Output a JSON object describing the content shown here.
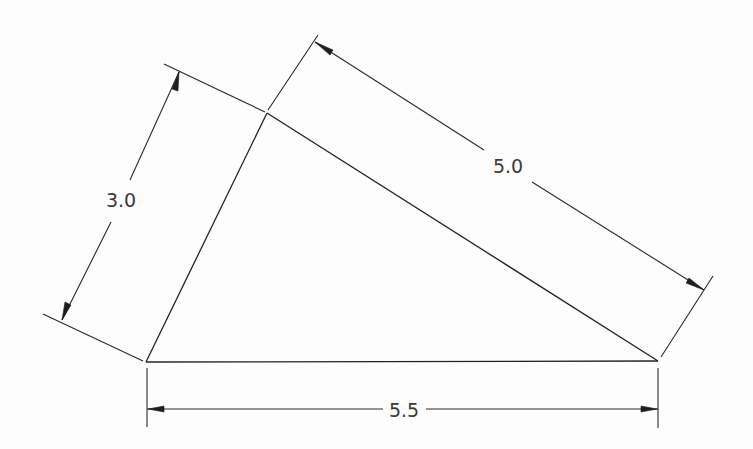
{
  "drawing": {
    "title": "Triangle with dimensioned sides",
    "line_color": "#222222",
    "text_color": "#3a3a3a",
    "background": "#ffffff",
    "vertices": {
      "left": {
        "x": 146,
        "y": 362
      },
      "apex": {
        "x": 267,
        "y": 113
      },
      "right": {
        "x": 658,
        "y": 361
      }
    },
    "dimensions": [
      {
        "id": "left-side",
        "label": "3.0",
        "side": "left vertex to apex"
      },
      {
        "id": "hypotenuse",
        "label": "5.0",
        "side": "apex to right vertex"
      },
      {
        "id": "base",
        "label": "5.5",
        "side": "left vertex to right vertex"
      }
    ]
  }
}
